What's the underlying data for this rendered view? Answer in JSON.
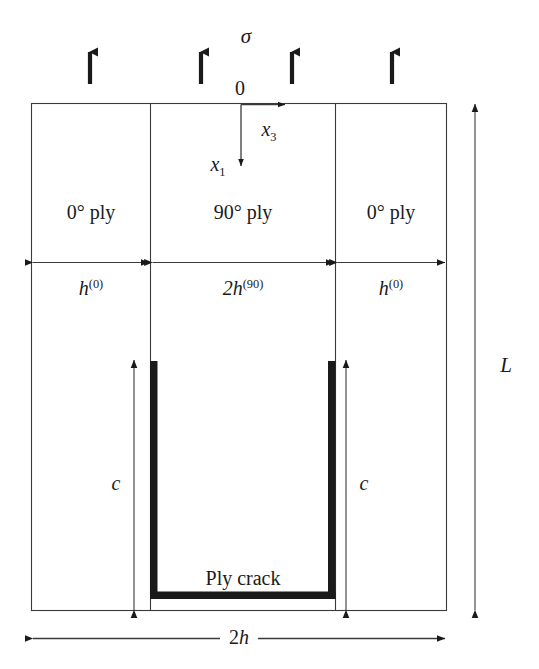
{
  "figure": {
    "title_text": "Cross-ply laminate with ply crack schematic",
    "background_color": "#ffffff",
    "line_color": "#1a1a1a",
    "crack_color": "#1a1a1a"
  },
  "load": {
    "stress_symbol": "σ",
    "arrow_count": 4,
    "arrow_label": "applied-stress-arrow"
  },
  "axes": {
    "origin_label": "0",
    "horizontal_axis": "x",
    "horizontal_axis_sub": "3",
    "vertical_axis": "x",
    "vertical_axis_sub": "1"
  },
  "plies": [
    {
      "label_main": "0",
      "label_deg": "°",
      "label_tail": " ply",
      "full": "0° ply"
    },
    {
      "label_main": "90",
      "label_deg": "°",
      "label_tail": " ply",
      "full": "90° ply"
    },
    {
      "label_main": "0",
      "label_deg": "°",
      "label_tail": " ply",
      "full": "0° ply"
    }
  ],
  "thickness_dims": [
    {
      "base": "h",
      "sup": "(0)",
      "full": "h(0)"
    },
    {
      "base": "2h",
      "sup": "(90)",
      "full": "2h(90)"
    },
    {
      "base": "h",
      "sup": "(0)",
      "full": "h(0)"
    }
  ],
  "crack": {
    "label": "Ply crack",
    "depth_label_left": "c",
    "depth_label_right": "c"
  },
  "overall_dims": {
    "height_label": "L",
    "width_label_prefix": "2",
    "width_label_base": "h",
    "width_label_full": "2h"
  }
}
